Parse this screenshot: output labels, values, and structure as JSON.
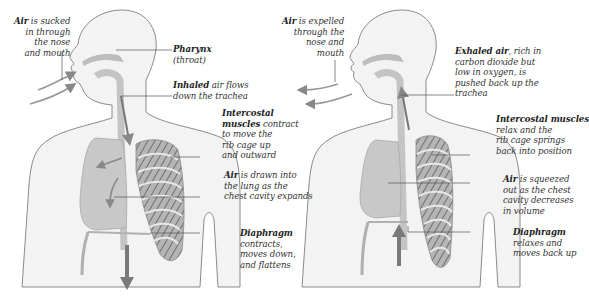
{
  "diagram": {
    "colors": {
      "body_outline": "#8a8a8a",
      "body_fill": "#f2f2f2",
      "lung_fill": "#c9c9c9",
      "rib_fill": "#9a9a9a",
      "arrow": "#7a7a7a",
      "leader_line": "#555555",
      "text": "#333333"
    },
    "panels": [
      {
        "id": "inhalation",
        "labels": {
          "air_in": {
            "bold": "Air",
            "rest_1": " is sucked",
            "line_2": "in through",
            "line_3": "the nose",
            "line_4": "and mouth"
          },
          "pharynx": {
            "bold": "Pharynx",
            "line_2": "(throat)"
          },
          "inhaled": {
            "bold": "Inhaled",
            "rest_1": " air flows",
            "line_2": "down the trachea"
          },
          "intercostal": {
            "bold_1": "Intercostal",
            "bold_2": "muscles",
            "rest_2": " contract",
            "line_3": "to move the",
            "line_4": "rib cage up",
            "line_5": "and outward"
          },
          "lung": {
            "bold": "Air",
            "rest_1": " is drawn into",
            "line_2": "the lung as the",
            "line_3": "chest cavity expands"
          },
          "diaphragm": {
            "bold": "Diaphragm",
            "line_2": "contracts,",
            "line_3": "moves down,",
            "line_4": "and flattens"
          }
        },
        "diaphragm_arrow": "down"
      },
      {
        "id": "exhalation",
        "labels": {
          "air_out": {
            "bold": "Air",
            "rest_1": " is expelled",
            "line_2": "through the",
            "line_3": "nose and",
            "line_4": "mouth"
          },
          "exhaled": {
            "bold": "Exhaled air",
            "rest_1": ", rich in",
            "line_2": "carbon dioxide but",
            "line_3": "low in oxygen, is",
            "line_4": "pushed back up the",
            "line_5": "trachea"
          },
          "intercostal": {
            "bold": "Intercostal muscles",
            "line_2": "relax and the",
            "line_3": "rib cage springs",
            "line_4": "back into position"
          },
          "lung": {
            "bold": "Air",
            "rest_1": " is squeezed",
            "line_2": "out as the chest",
            "line_3": "cavity decreases",
            "line_4": "in volume"
          },
          "diaphragm": {
            "bold": "Diaphragm",
            "line_2": "relaxes and",
            "line_3": "moves back up"
          }
        },
        "diaphragm_arrow": "up"
      }
    ]
  }
}
